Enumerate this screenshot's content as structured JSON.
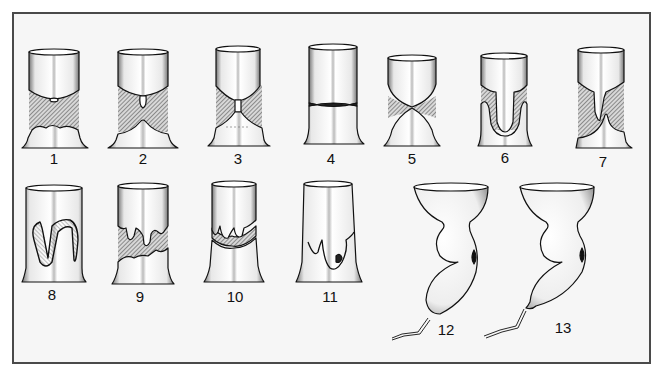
{
  "figure": {
    "colors": {
      "frame_border": "#4a4a4a",
      "frame_fill": "#f6f6f6",
      "ink": "#111111",
      "hatch": "#555555"
    },
    "rows": [
      {
        "panels": [
          {
            "id": "1",
            "label": "1",
            "x": 54,
            "y": 151
          },
          {
            "id": "2",
            "label": "2",
            "x": 143,
            "y": 151
          },
          {
            "id": "3",
            "label": "3",
            "x": 238,
            "y": 151
          },
          {
            "id": "4",
            "label": "4",
            "x": 331,
            "y": 151
          },
          {
            "id": "5",
            "label": "5",
            "x": 412,
            "y": 151
          },
          {
            "id": "6",
            "label": "6",
            "x": 505,
            "y": 150
          },
          {
            "id": "7",
            "label": "7",
            "x": 603,
            "y": 154
          }
        ]
      },
      {
        "panels": [
          {
            "id": "8",
            "label": "8",
            "x": 52,
            "y": 287
          },
          {
            "id": "9",
            "label": "9",
            "x": 140,
            "y": 289
          },
          {
            "id": "10",
            "label": "10",
            "x": 235,
            "y": 289
          },
          {
            "id": "11",
            "label": "11",
            "x": 330,
            "y": 289
          },
          {
            "id": "12",
            "label": "12",
            "x": 446,
            "y": 322
          },
          {
            "id": "13",
            "label": "13",
            "x": 563,
            "y": 320
          }
        ]
      }
    ]
  }
}
